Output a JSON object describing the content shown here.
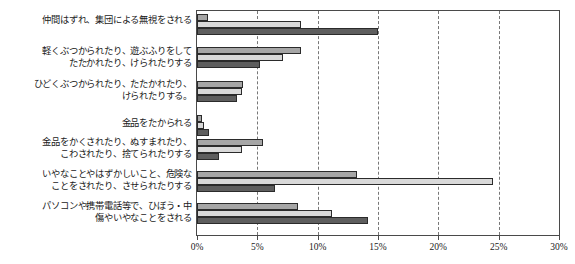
{
  "legend": {
    "title": "(上から順に)",
    "entries": [
      {
        "label": "小学校",
        "color": "#a6a6a6"
      },
      {
        "label": "中学校",
        "color": "#d9d9d9"
      },
      {
        "label": "高等学校",
        "color": "#5e5e5e"
      }
    ]
  },
  "axis": {
    "ticks": [
      "0%",
      "5%",
      "10%",
      "15%",
      "20%",
      "25%",
      "30%"
    ]
  },
  "chart_data": {
    "type": "bar",
    "orientation": "horizontal",
    "title": "",
    "xlabel": "",
    "ylabel": "",
    "xlim": [
      0,
      30
    ],
    "xticks": [
      0,
      5,
      10,
      15,
      20,
      25,
      30
    ],
    "grid": true,
    "legend_position": "inside-right",
    "legend_note": "(上から順に)",
    "categories": [
      "仲間はずれ、集団による無視をされる",
      "軽くぶつかられたり、遊ぶふりをして\nたたかれたり、けられたりする",
      "ひどくぶつかられたり、たたかれたり、\nけられたりする。",
      "金品をたかられる",
      "金品をかくされたり、ぬすまれたり、\nこわされたり、捨てられたりする",
      "いやなことやはずかしいこと、危険な\nことをされたり、させられたりする",
      "パソコンや携帯電話等で、ひぼう・中\n傷やいやなことをされる"
    ],
    "series": [
      {
        "name": "小学校",
        "color": "#a6a6a6",
        "values": [
          0.9,
          8.6,
          3.8,
          0.4,
          5.5,
          13.3,
          8.4
        ]
      },
      {
        "name": "中学校",
        "color": "#d9d9d9",
        "values": [
          8.6,
          7.1,
          3.7,
          0.6,
          3.7,
          24.5,
          11.2
        ]
      },
      {
        "name": "高等学校",
        "color": "#5e5e5e",
        "values": [
          15.0,
          5.2,
          3.3,
          1.0,
          1.8,
          6.5,
          14.2
        ]
      }
    ]
  }
}
